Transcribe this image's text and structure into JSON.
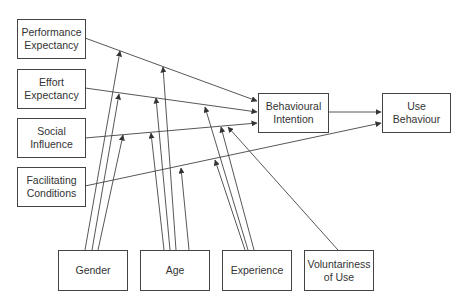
{
  "diagram": {
    "title": "",
    "constructs": {
      "performance_expectancy": "Performance\nExpectancy",
      "effort_expectancy": "Effort\nExpectancy",
      "social_influence": "Social\nInfluence",
      "facilitating_conditions": "Facilitating\nConditions",
      "behavioural_intention": "Behavioural\nIntention",
      "use_behaviour": "Use\nBehaviour"
    },
    "moderators": {
      "gender": "Gender",
      "age": "Age",
      "experience": "Experience",
      "voluntariness": "Voluntariness\nof Use"
    },
    "edges": [
      {
        "from": "Performance Expectancy",
        "to": "Behavioural Intention"
      },
      {
        "from": "Effort Expectancy",
        "to": "Behavioural Intention"
      },
      {
        "from": "Social Influence",
        "to": "Behavioural Intention"
      },
      {
        "from": "Facilitating Conditions",
        "to": "Use Behaviour"
      },
      {
        "from": "Behavioural Intention",
        "to": "Use Behaviour"
      },
      {
        "from": "Gender",
        "to": "PE→BI"
      },
      {
        "from": "Gender",
        "to": "EE→BI"
      },
      {
        "from": "Gender",
        "to": "SI→BI"
      },
      {
        "from": "Age",
        "to": "PE→BI"
      },
      {
        "from": "Age",
        "to": "EE→BI"
      },
      {
        "from": "Age",
        "to": "SI→BI"
      },
      {
        "from": "Age",
        "to": "FC→UB"
      },
      {
        "from": "Experience",
        "to": "EE→BI"
      },
      {
        "from": "Experience",
        "to": "SI→BI"
      },
      {
        "from": "Experience",
        "to": "FC→UB"
      },
      {
        "from": "Voluntariness of Use",
        "to": "SI→BI"
      }
    ]
  }
}
